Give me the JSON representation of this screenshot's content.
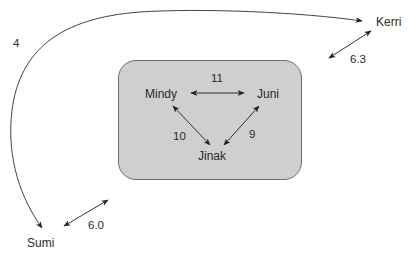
{
  "diagram": {
    "group": {
      "label": "",
      "fill_color": "#cfcfcf",
      "members": [
        "Mindy",
        "Juni",
        "Jinak"
      ]
    },
    "nodes": [
      {
        "id": "kerri",
        "label": "Kerri"
      },
      {
        "id": "mindy",
        "label": "Mindy"
      },
      {
        "id": "juni",
        "label": "Juni"
      },
      {
        "id": "jinak",
        "label": "Jinak"
      },
      {
        "id": "sumi",
        "label": "Sumi"
      }
    ],
    "edges": [
      {
        "from": "Kerri",
        "to": "Sumi",
        "label": "4",
        "style": "curved-arc",
        "direction": "both"
      },
      {
        "from": "Mindy",
        "to": "Juni",
        "label": "11",
        "direction": "both"
      },
      {
        "from": "Mindy",
        "to": "Jinak",
        "label": "10",
        "direction": "both"
      },
      {
        "from": "Juni",
        "to": "Jinak",
        "label": "9",
        "direction": "both"
      },
      {
        "from": "Kerri",
        "to": "group",
        "label": "6.3",
        "direction": "both"
      },
      {
        "from": "Sumi",
        "to": "group",
        "label": "6.0",
        "direction": "both"
      }
    ],
    "line_color": "#333333"
  }
}
